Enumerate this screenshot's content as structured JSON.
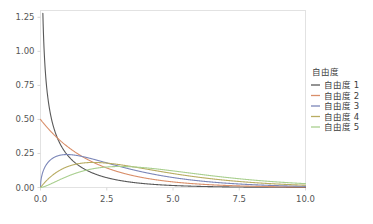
{
  "chart_data": {
    "type": "line",
    "title": "",
    "xlabel": "",
    "ylabel": "",
    "xlim": [
      0,
      10
    ],
    "ylim": [
      0,
      1.3
    ],
    "grid": false,
    "legend_position": "right",
    "legend_title": "自由度",
    "xticks": [
      "0.0",
      "2.5",
      "5.0",
      "7.5",
      "10.0"
    ],
    "xtick_values": [
      0,
      2.5,
      5,
      7.5,
      10
    ],
    "yticks": [
      "0.00",
      "0.25",
      "0.50",
      "0.75",
      "1.00",
      "1.25"
    ],
    "ytick_values": [
      0,
      0.25,
      0.5,
      0.75,
      1.0,
      1.25
    ],
    "distribution": "chi-squared probability density",
    "series": [
      {
        "name": "自由度 1",
        "df": 1,
        "color": "#595959",
        "x": [
          0.05,
          0.1,
          0.2,
          0.3,
          0.5,
          0.75,
          1.0,
          1.5,
          2.0,
          2.5,
          3.0,
          4.0,
          5.0,
          6.0,
          7.0,
          8.0,
          9.0,
          10.0
        ],
        "values": [
          1.74,
          1.2,
          0.807,
          0.628,
          0.439,
          0.33,
          0.242,
          0.154,
          0.104,
          0.072,
          0.051,
          0.027,
          0.0146,
          0.0081,
          0.0046,
          0.0027,
          0.0016,
          0.0009
        ]
      },
      {
        "name": "自由度 2",
        "df": 2,
        "color": "#d98f6a",
        "x": [
          0.0,
          0.5,
          1.0,
          1.5,
          2.0,
          2.5,
          3.0,
          4.0,
          5.0,
          6.0,
          7.0,
          8.0,
          9.0,
          10.0
        ],
        "values": [
          0.5,
          0.389,
          0.303,
          0.236,
          0.184,
          0.143,
          0.112,
          0.068,
          0.041,
          0.025,
          0.015,
          0.009,
          0.0056,
          0.0034
        ]
      },
      {
        "name": "自由度 3",
        "df": 3,
        "color": "#7b86b8",
        "x": [
          0.0,
          0.25,
          0.5,
          0.75,
          1.0,
          1.5,
          2.0,
          2.5,
          3.0,
          4.0,
          5.0,
          6.0,
          7.0,
          8.0,
          9.0,
          10.0
        ],
        "values": [
          0.0,
          0.176,
          0.219,
          0.234,
          0.242,
          0.232,
          0.207,
          0.18,
          0.154,
          0.108,
          0.073,
          0.049,
          0.032,
          0.02,
          0.013,
          0.0085
        ]
      },
      {
        "name": "自由度 4",
        "df": 4,
        "color": "#b8ac62",
        "x": [
          0.0,
          0.5,
          1.0,
          1.5,
          2.0,
          2.5,
          3.0,
          3.5,
          4.0,
          5.0,
          6.0,
          7.0,
          8.0,
          9.0,
          10.0
        ],
        "values": [
          0.0,
          0.097,
          0.152,
          0.177,
          0.184,
          0.179,
          0.167,
          0.152,
          0.135,
          0.103,
          0.075,
          0.053,
          0.037,
          0.025,
          0.017
        ]
      },
      {
        "name": "自由度 5",
        "df": 5,
        "color": "#a9cf8f",
        "x": [
          0.0,
          0.5,
          1.0,
          1.5,
          2.0,
          2.5,
          3.0,
          3.5,
          4.0,
          5.0,
          6.0,
          7.0,
          8.0,
          9.0,
          10.0
        ],
        "values": [
          0.0,
          0.044,
          0.08,
          0.11,
          0.138,
          0.147,
          0.154,
          0.152,
          0.146,
          0.122,
          0.097,
          0.073,
          0.053,
          0.038,
          0.027
        ]
      }
    ]
  },
  "legend": {
    "title": "自由度",
    "entries": [
      {
        "label": "自由度 1",
        "color": "#595959"
      },
      {
        "label": "自由度 2",
        "color": "#d98f6a"
      },
      {
        "label": "自由度 3",
        "color": "#7b86b8"
      },
      {
        "label": "自由度 4",
        "color": "#b8ac62"
      },
      {
        "label": "自由度 5",
        "color": "#a9cf8f"
      }
    ]
  },
  "axes": {
    "x_tick_labels": [
      "0.0",
      "2.5",
      "5.0",
      "7.5",
      "10.0"
    ],
    "y_tick_labels": [
      "0.00",
      "0.25",
      "0.50",
      "0.75",
      "1.00",
      "1.25"
    ]
  },
  "colors": {
    "frame": "#e2e2e2",
    "tick_text": "#555555",
    "legend_text": "#3c3c3c",
    "background": "#ffffff"
  }
}
